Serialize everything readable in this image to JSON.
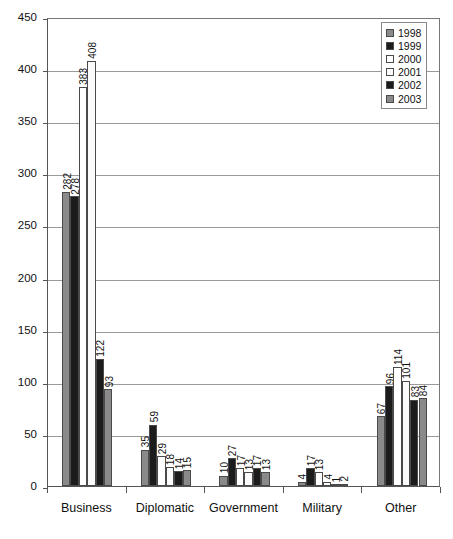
{
  "chart_data": {
    "type": "bar",
    "title": "",
    "subtitle": "",
    "xlabel": "",
    "ylabel": "",
    "ylim": [
      0,
      450
    ],
    "ytick_step": 50,
    "yticks": [
      0,
      50,
      100,
      150,
      200,
      250,
      300,
      350,
      400,
      450
    ],
    "grid": true,
    "grid_axis": "y",
    "legend_position": "top-right",
    "value_labels": true,
    "value_label_orientation": "vertical",
    "categories": [
      "Business",
      "Diplomatic",
      "Government",
      "Military",
      "Other"
    ],
    "series": [
      {
        "name": "1998",
        "color": "#8a8a8a",
        "values": [
          282,
          35,
          10,
          4,
          67
        ]
      },
      {
        "name": "1999",
        "color": "#1c1c1c",
        "values": [
          278,
          59,
          27,
          17,
          96
        ]
      },
      {
        "name": "2000",
        "color": "#ffffff",
        "values": [
          383,
          29,
          17,
          13,
          114
        ]
      },
      {
        "name": "2001",
        "color": "#fbfbfb",
        "values": [
          408,
          18,
          13,
          4,
          101
        ]
      },
      {
        "name": "2002",
        "color": "#1c1c1c",
        "values": [
          122,
          14,
          17,
          1,
          83
        ]
      },
      {
        "name": "2003",
        "color": "#8a8a8a",
        "values": [
          93,
          15,
          13,
          2,
          84
        ]
      }
    ]
  },
  "legend": {
    "entries": [
      {
        "label": "1998"
      },
      {
        "label": "1999"
      },
      {
        "label": "2000"
      },
      {
        "label": "2001"
      },
      {
        "label": "2002"
      },
      {
        "label": "2003"
      }
    ]
  },
  "axes": {
    "y_tick_labels": [
      "450",
      "400",
      "350",
      "300",
      "250",
      "200",
      "150",
      "100",
      "50",
      "0"
    ],
    "x_category_labels": [
      "Business",
      "Diplomatic",
      "Government",
      "Military",
      "Other"
    ]
  }
}
